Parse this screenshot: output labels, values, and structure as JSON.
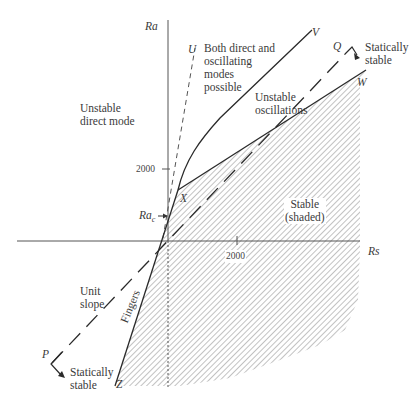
{
  "diagram": {
    "axes": {
      "y_label": "Ra",
      "x_label": "Rs",
      "y_tick": "2000",
      "x_tick": "2000",
      "critical_label": "Ra",
      "critical_subscript": "c"
    },
    "points": {
      "U": "U",
      "V": "V",
      "W": "W",
      "X": "X",
      "Z": "Z",
      "P": "P",
      "Q": "Q"
    },
    "regions": {
      "unstable_direct": [
        "Unstable",
        "direct mode"
      ],
      "both_modes": [
        "Both direct and",
        "oscillating",
        "modes",
        "possible"
      ],
      "unstable_osc": [
        "Unstable",
        "oscillations"
      ],
      "stable": [
        "Stable",
        "(shaded)"
      ],
      "statically_stable_q": [
        "Statically",
        "stable"
      ],
      "statically_stable_p": [
        "Statically",
        "stable"
      ],
      "unit_slope": [
        "Unit",
        "slope"
      ],
      "fingers": "Fingers"
    },
    "colors": {
      "line": "#2a2a2a",
      "hatch": "#9a9a9a",
      "text": "#3a3a3a"
    }
  }
}
